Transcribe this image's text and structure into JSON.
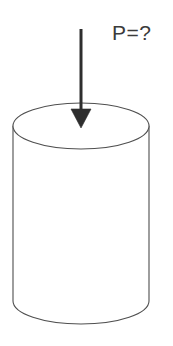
{
  "figure": {
    "kind": "engineering-free-body-diagram",
    "background_color": "#ffffff",
    "canvas": {
      "width": 173,
      "height": 346
    }
  },
  "annotations": {
    "force_label": "P=?",
    "force_label_color": "#3b3b3b",
    "force_label_font_size": "21px",
    "force_label_position": {
      "x": 112,
      "y": 20
    }
  },
  "arrow": {
    "name": "downward-force-arrow",
    "color": "#2e2e2e",
    "shaft_width": 3,
    "shaft_top": {
      "x": 81,
      "y": 29
    },
    "shaft_bottom": {
      "x": 81,
      "y": 111
    },
    "head_left": {
      "x": 71,
      "y": 109
    },
    "head_right": {
      "x": 91,
      "y": 109
    },
    "head_tip": {
      "x": 81,
      "y": 128
    }
  },
  "cylinder": {
    "name": "cylinder-body",
    "stroke_color": "#4f4f4f",
    "stroke_width": 1,
    "fill_color": "#ffffff",
    "center_x": 81,
    "radius_x": 68,
    "radius_y": 23,
    "top_ellipse_center_y": 126,
    "bottom_ellipse_center_y": 301,
    "left_x": 13,
    "right_x": 149,
    "top_y": 103,
    "bottom_y": 324
  }
}
